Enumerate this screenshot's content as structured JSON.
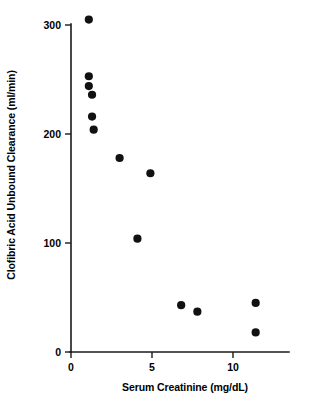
{
  "chart_data": {
    "type": "scatter",
    "title": "",
    "xlabel": "Serum Creatinine (mg/dL)",
    "ylabel": "Clofibric Acid Unbound Clearance (ml/min)",
    "xlim": [
      0,
      13.4
    ],
    "ylim": [
      0,
      315
    ],
    "xticks": [
      0,
      5,
      10
    ],
    "xtick_labels": [
      "0",
      "5",
      "10"
    ],
    "yticks": [
      0,
      100,
      200,
      300
    ],
    "ytick_labels": [
      "0",
      "100",
      "200",
      "300"
    ],
    "grid": false,
    "legend": null,
    "marker": "filled-circle",
    "marker_color": "#111111",
    "points": [
      {
        "x": 1.1,
        "y": 305
      },
      {
        "x": 1.1,
        "y": 253
      },
      {
        "x": 1.1,
        "y": 244
      },
      {
        "x": 1.3,
        "y": 236
      },
      {
        "x": 1.3,
        "y": 216
      },
      {
        "x": 1.4,
        "y": 204
      },
      {
        "x": 3.0,
        "y": 178
      },
      {
        "x": 4.1,
        "y": 104
      },
      {
        "x": 4.9,
        "y": 164
      },
      {
        "x": 6.8,
        "y": 43
      },
      {
        "x": 7.8,
        "y": 37
      },
      {
        "x": 11.4,
        "y": 45
      },
      {
        "x": 11.4,
        "y": 18
      }
    ]
  },
  "axis": {
    "x_tick_0": "0",
    "x_tick_5": "5",
    "x_tick_10": "10",
    "y_tick_0": "0",
    "y_tick_100": "100",
    "y_tick_200": "200",
    "y_tick_300": "300"
  }
}
